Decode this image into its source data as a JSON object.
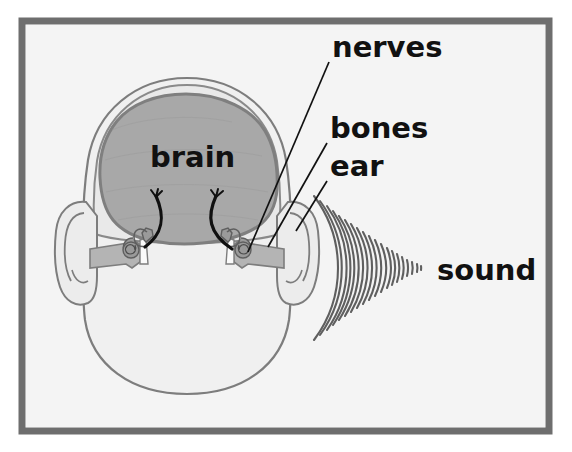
{
  "figure": {
    "background_color": "#ffffff",
    "panel_color": "#f4f4f4",
    "frame_color": "#6e6e6e"
  },
  "labels": {
    "nerves": "nerves",
    "bones": "bones",
    "ear": "ear",
    "sound": "sound",
    "brain": "brain"
  },
  "colors": {
    "head_fill": "#f0f0f0",
    "head_outline": "#7d7d7d",
    "skull_fill": "#e8e8e8",
    "brain_fill": "#a8a8a8",
    "brain_outline": "#7f7f7f",
    "ear_fill": "#e4e4e4",
    "canal_fill": "#b4b4b4",
    "ossicle_fill": "#9a9a9a",
    "nerve_color": "#101010",
    "wave_color": "#5f5f5f",
    "leader_color": "#111111",
    "text_color": "#111111"
  },
  "anatomy": {
    "parts": [
      "skull outline",
      "brain",
      "left outer ear",
      "right outer ear",
      "left ear canal",
      "right ear canal",
      "left middle ear bones (ossicles)",
      "right middle ear bones (ossicles)",
      "left auditory nerve",
      "right auditory nerve",
      "sound waves"
    ],
    "sound_wave_count": 20
  }
}
